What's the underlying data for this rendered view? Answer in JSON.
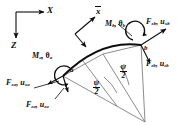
{
  "figure": {
    "type": "curved-beam-element-force-diagram",
    "stroke_color": "#0d0d0d",
    "background": "#ffffff"
  },
  "global_axes": {
    "x_label": "X",
    "z_label": "Z",
    "origin": {
      "x": 16,
      "y": 12
    }
  },
  "local_axis": {
    "label": "x",
    "overbar": true
  },
  "nodes": [
    {
      "id": "a",
      "label": "a",
      "x": 63,
      "y": 76
    },
    {
      "id": "b",
      "label": "b",
      "x": 141,
      "y": 45
    }
  ],
  "labels": {
    "moment_a": {
      "symbol": "M",
      "sub": "a",
      "pair": "θ",
      "pair_sub": "a",
      "text": "M a , θ a"
    },
    "moment_b": {
      "symbol": "M",
      "sub": "b",
      "pair": "θ",
      "pair_sub": "b",
      "text": "M b , θ b"
    },
    "force_xa": {
      "symbol": "F",
      "sub": "xa",
      "pair": "u",
      "pair_sub": "xa",
      "text": "F xa , u xa"
    },
    "force_za": {
      "symbol": "F",
      "sub": "za",
      "pair": "u",
      "pair_sub": "za",
      "text": "F za , u za"
    },
    "force_xb": {
      "symbol": "F",
      "sub": "xb",
      "pair": "u",
      "pair_sub": "xb",
      "text": "F xb , u xb"
    },
    "force_zb": {
      "symbol": "F",
      "sub": "zb",
      "pair": "u",
      "pair_sub": "zb",
      "text": "F zb , u zb"
    }
  },
  "angles": {
    "half_angle_numerator": "ψ",
    "half_angle_denominator": "2",
    "count": 2,
    "note": "two equal psi/2 sectors measured at the arc centre"
  }
}
